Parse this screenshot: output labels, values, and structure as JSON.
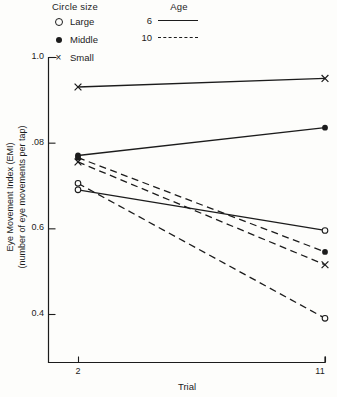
{
  "figure": {
    "background": "#fdfdfb",
    "ink": "#1c1c1c"
  },
  "legend": {
    "circle_size": {
      "title": "Circle size",
      "items": [
        {
          "marker": "open-circle",
          "label": "Large"
        },
        {
          "marker": "filled-circle",
          "label": "Middle"
        },
        {
          "marker": "x-cross",
          "label": "Small"
        }
      ]
    },
    "age": {
      "title": "Age",
      "items": [
        {
          "label": "6",
          "line": "solid"
        },
        {
          "label": "10",
          "line": "dashed"
        }
      ]
    }
  },
  "chart_data": {
    "type": "line",
    "title": "",
    "xlabel": "Trial",
    "ylabel": "Eye Movement Index (EMI)",
    "ylabel_sub": "(number of eye movements per tap)",
    "x": [
      2,
      11
    ],
    "xtick_labels": [
      "2",
      "11"
    ],
    "ytick_labels": [
      "1.0",
      ".08",
      "0.6",
      "0.4"
    ],
    "ytick_values": [
      1.0,
      0.8,
      0.6,
      0.4
    ],
    "ylim": [
      0.29,
      1.0
    ],
    "grid": false,
    "legend_position": "top-left",
    "series": [
      {
        "name": "Small circle, Age 6",
        "circle_size": "Small",
        "age": 6,
        "marker": "x-cross",
        "line": "solid",
        "values": [
          0.93,
          0.95
        ]
      },
      {
        "name": "Middle circle, Age 6",
        "circle_size": "Middle",
        "age": 6,
        "marker": "filled-circle",
        "line": "solid",
        "values": [
          0.77,
          0.835
        ]
      },
      {
        "name": "Large circle, Age 6",
        "circle_size": "Large",
        "age": 6,
        "marker": "open-circle",
        "line": "solid",
        "values": [
          0.69,
          0.595
        ]
      },
      {
        "name": "Middle circle, Age 10",
        "circle_size": "Middle",
        "age": 10,
        "marker": "filled-circle",
        "line": "dashed",
        "values": [
          0.765,
          0.545
        ]
      },
      {
        "name": "Small circle, Age 10",
        "circle_size": "Small",
        "age": 10,
        "marker": "x-cross",
        "line": "dashed",
        "values": [
          0.755,
          0.515
        ]
      },
      {
        "name": "Large circle, Age 10",
        "circle_size": "Large",
        "age": 10,
        "marker": "open-circle",
        "line": "dashed",
        "values": [
          0.705,
          0.39
        ]
      }
    ]
  }
}
